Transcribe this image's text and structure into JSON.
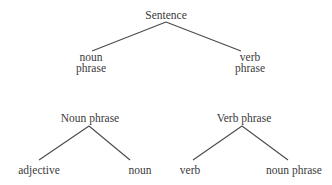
{
  "diagram": {
    "type": "parse-tree-rules",
    "trees": [
      {
        "id": "sentence-tree",
        "root": {
          "label": "Sentence"
        },
        "children": [
          {
            "lines": [
              "noun",
              "phrase"
            ]
          },
          {
            "lines": [
              "verb",
              "phrase"
            ]
          }
        ]
      },
      {
        "id": "noun-phrase-tree",
        "root": {
          "label": "Noun phrase"
        },
        "children": [
          {
            "lines": [
              "adjective"
            ]
          },
          {
            "lines": [
              "noun"
            ]
          }
        ]
      },
      {
        "id": "verb-phrase-tree",
        "root": {
          "label": "Verb phrase"
        },
        "children": [
          {
            "lines": [
              "verb"
            ]
          },
          {
            "lines": [
              "noun phrase"
            ]
          }
        ]
      }
    ],
    "colors": {
      "background": "#ffffff",
      "text": "#3a3a3a",
      "line": "#4a4a4a"
    }
  }
}
